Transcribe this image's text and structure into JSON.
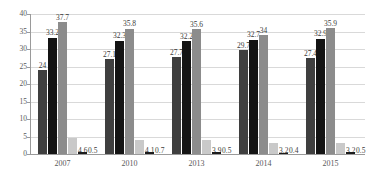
{
  "chart_data": {
    "type": "bar",
    "title": "",
    "subtitle": "",
    "xlabel": "",
    "ylabel": "",
    "categories": [
      "2007",
      "2010",
      "2013",
      "2014",
      "2015"
    ],
    "ylim": [
      0,
      40
    ],
    "ytick_labels": [
      "0",
      "5",
      "10",
      "15",
      "20",
      "25",
      "30",
      "35",
      "40"
    ],
    "ytick_values": [
      0,
      5,
      10,
      15,
      20,
      25,
      30,
      35,
      40
    ],
    "grid": true,
    "legend": "none",
    "series": [
      {
        "name": "series-1",
        "color": "#3f3f3f",
        "values": [
          24,
          27.1,
          27.7,
          29.7,
          27.4
        ],
        "labels": [
          "24",
          "27.1",
          "27.7",
          "29.7",
          "27.4"
        ]
      },
      {
        "name": "series-2",
        "color": "#141414",
        "values": [
          33.2,
          32.3,
          32.2,
          32.7,
          32.9
        ],
        "labels": [
          "33.2",
          "32.3",
          "32.2",
          "32.7",
          "32.9"
        ]
      },
      {
        "name": "series-3",
        "color": "#8c8c8c",
        "values": [
          37.7,
          35.8,
          35.6,
          34,
          35.9
        ],
        "labels": [
          "37.7",
          "35.8",
          "35.6",
          "34",
          "35.9"
        ]
      },
      {
        "name": "series-4",
        "color": "#c9c9c9",
        "values": [
          4.6,
          4.1,
          3.9,
          3.2,
          3.2
        ],
        "labels": [
          "4.6",
          "4.1",
          "3.9",
          "3.2",
          "3.2"
        ]
      },
      {
        "name": "series-5",
        "color": "#1c1c1c",
        "values": [
          0.5,
          0.7,
          0.5,
          0.4,
          0.5
        ],
        "labels": [
          "0.5",
          "0.7",
          "0.5",
          "0.4",
          "0.5"
        ]
      }
    ]
  },
  "style": {
    "background": "#ffffff",
    "gridline_color": "#d9d9d9",
    "axis_color": "#9a9a9a",
    "tick_text_color": "#595959",
    "value_text_color": "#3b3b3b"
  }
}
